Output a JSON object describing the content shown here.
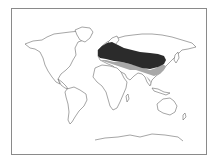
{
  "map": {
    "type": "world-distribution-map",
    "projection": "world outline",
    "colors": {
      "background": "#ffffff",
      "frame": "#8a8a8a",
      "coastline": "#6a6a6a",
      "range_primary": "#2b2b2b",
      "range_secondary": "#a8a8a8"
    },
    "legend": [],
    "regions": [
      {
        "name": "primary-range",
        "description": "Europe through Central Asia to northern China",
        "shade": "dark"
      },
      {
        "name": "secondary-range",
        "description": "Southern margin: Mediterranean, Middle East, South & Southeast Asia, southern China",
        "shade": "gray"
      }
    ]
  }
}
